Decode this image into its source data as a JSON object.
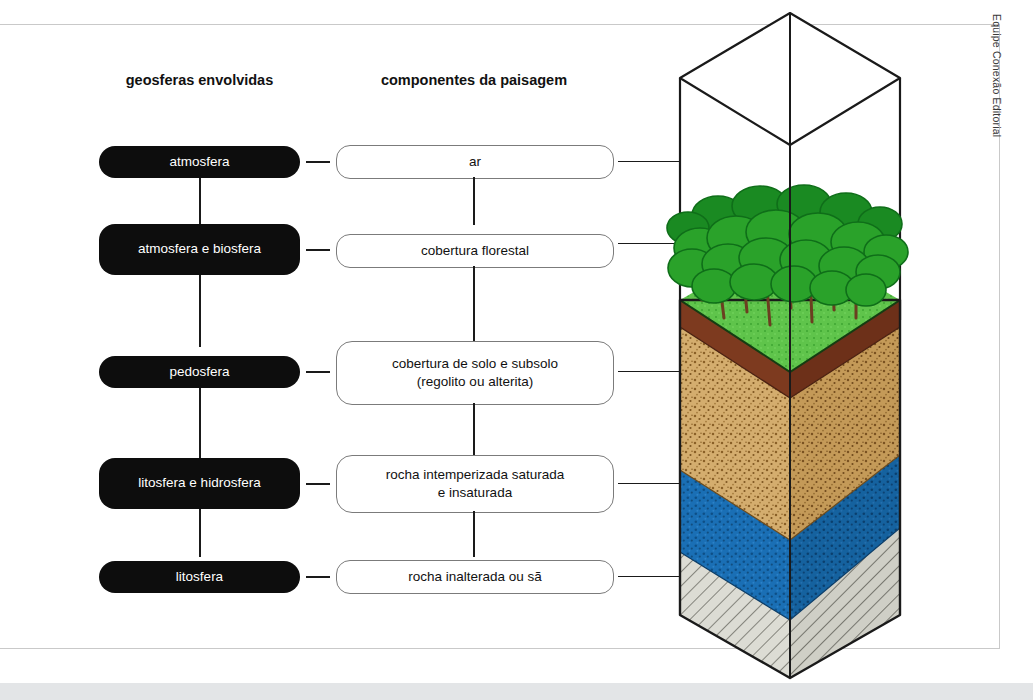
{
  "credit": "Equipe Conexão Editorial",
  "headings": {
    "left": "geosferas envolvidas",
    "right": "componentes da paisagem"
  },
  "colors": {
    "pill_dark": "#0d0d0d",
    "pill_light_border": "#7b7b7b",
    "canopy_green": "#2aa22a",
    "canopy_dark": "#0f6e19",
    "grass_green": "#5fc44b",
    "trunk_brown": "#6b3f20",
    "topsoil_brown": "#8a3b22",
    "soil_tan": "#d4ad6e",
    "saturated_blue": "#1a6fb5",
    "bedrock_gray": "#dcdcd4",
    "outline": "#1a1a1a"
  },
  "rows": [
    {
      "geosphere": "atmosfera",
      "component": "ar",
      "component_line2": "",
      "layer_name": "air-layer"
    },
    {
      "geosphere": "atmosfera e biosfera",
      "component": "cobertura florestal",
      "component_line2": "",
      "layer_name": "forest-layer"
    },
    {
      "geosphere": "pedosfera",
      "component": "cobertura de solo e subsolo",
      "component_line2": "(regolito ou alterita)",
      "layer_name": "soil-layer"
    },
    {
      "geosphere": "litosfera e hidrosfera",
      "component": "rocha intemperizada saturada",
      "component_line2": "e insaturada",
      "layer_name": "weathered-rock-layer"
    },
    {
      "geosphere": "litosfera",
      "component": "rocha inalterada ou sã",
      "component_line2": "",
      "layer_name": "bedrock-layer"
    }
  ]
}
